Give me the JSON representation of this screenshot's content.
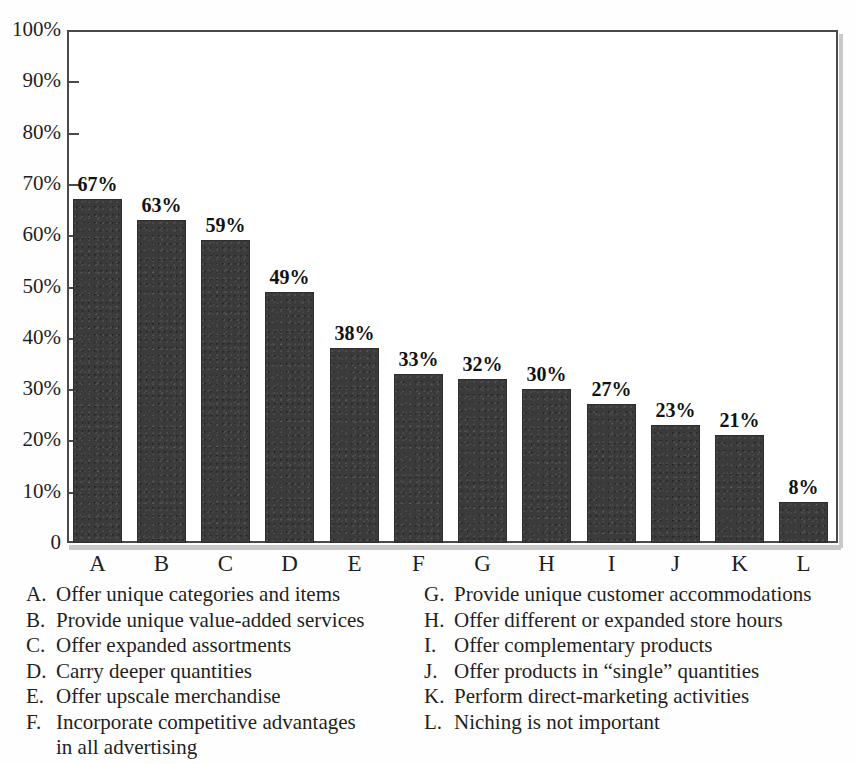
{
  "chart_data": {
    "type": "bar",
    "title": "",
    "xlabel": "",
    "ylabel": "",
    "categories": [
      "A",
      "B",
      "C",
      "D",
      "E",
      "F",
      "G",
      "H",
      "I",
      "J",
      "K",
      "L"
    ],
    "values": [
      67,
      63,
      59,
      49,
      38,
      33,
      32,
      30,
      27,
      23,
      21,
      8
    ],
    "value_labels": [
      "67%",
      "63%",
      "59%",
      "49%",
      "38%",
      "33%",
      "32%",
      "30%",
      "27%",
      "23%",
      "21%",
      "8%"
    ],
    "ylim": [
      0,
      100
    ],
    "ytick_values": [
      0,
      10,
      20,
      30,
      40,
      50,
      60,
      70,
      80,
      90,
      100
    ],
    "ytick_labels": [
      "0",
      "10%",
      "20%",
      "30%",
      "40%",
      "50%",
      "60%",
      "70%",
      "80%",
      "90%",
      "100%"
    ],
    "grid": false,
    "legend_position": "below-plot",
    "bar_color": "#3b3b3b",
    "axis_color": "#4a4a4a"
  },
  "legend": {
    "left_column": [
      {
        "key": "A.",
        "text": "Offer unique categories and items"
      },
      {
        "key": "B.",
        "text": "Provide unique value-added services"
      },
      {
        "key": "C.",
        "text": "Offer expanded assortments"
      },
      {
        "key": "D.",
        "text": "Carry deeper quantities"
      },
      {
        "key": "E.",
        "text": "Offer upscale merchandise"
      },
      {
        "key": "F.",
        "text": "Incorporate competitive advantages"
      }
    ],
    "left_continuation": "in all advertising",
    "right_column": [
      {
        "key": "G.",
        "text": "Provide unique customer accommodations"
      },
      {
        "key": "H.",
        "text": "Offer different or expanded store hours"
      },
      {
        "key": "I.",
        "text": "Offer complementary products"
      },
      {
        "key": "J.",
        "text": "Offer products in “single” quantities"
      },
      {
        "key": "K.",
        "text": "Perform direct-marketing activities"
      },
      {
        "key": "L.",
        "text": "Niching is not important"
      }
    ]
  }
}
